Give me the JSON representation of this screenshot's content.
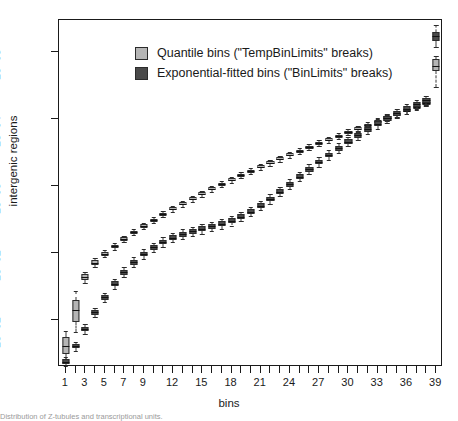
{
  "chart_data": {
    "type": "box",
    "title": "",
    "xlabel": "bins",
    "ylabel": "intergenic regions",
    "yscale": "log",
    "ylim": [
      2,
      300000
    ],
    "xlim": [
      0.3,
      39.7
    ],
    "grid": false,
    "legend_position": "top-left",
    "y_ticks": [
      "1e+01",
      "1e+02",
      "1e+03",
      "1e+04",
      "1e+05"
    ],
    "y_tick_values": [
      10,
      100,
      1000,
      10000,
      100000
    ],
    "x_ticks": [
      "1",
      "3",
      "5",
      "7",
      "9",
      "12",
      "15",
      "18",
      "21",
      "24",
      "27",
      "30",
      "33",
      "36",
      "39"
    ],
    "x_tick_values": [
      1,
      3,
      5,
      7,
      9,
      12,
      15,
      18,
      21,
      24,
      27,
      30,
      33,
      36,
      39
    ],
    "categories": [
      1,
      2,
      3,
      4,
      5,
      6,
      7,
      8,
      9,
      10,
      11,
      12,
      13,
      14,
      15,
      16,
      17,
      18,
      19,
      20,
      21,
      22,
      23,
      24,
      25,
      26,
      27,
      28,
      29,
      30,
      31,
      32,
      33,
      34,
      35,
      36,
      37,
      38,
      39
    ],
    "series": [
      {
        "name": "Quantile bins (\"TempBinLimits\" breaks)",
        "color": "#b5b5b5",
        "boxes": [
          {
            "bin": 1,
            "low": 2.6,
            "q1": 3.1,
            "median": 4.1,
            "q3": 5.6,
            "high": 7.0
          },
          {
            "bin": 2,
            "low": 6.6,
            "q1": 9.5,
            "median": 14.0,
            "q3": 20.0,
            "high": 27.0
          },
          {
            "bin": 3,
            "low": 36.0,
            "q1": 40.0,
            "median": 44.0,
            "q3": 48.0,
            "high": 53.0
          },
          {
            "bin": 4,
            "low": 62.0,
            "q1": 67.0,
            "median": 72.0,
            "q3": 78.0,
            "high": 84.0
          },
          {
            "bin": 5,
            "low": 86.0,
            "q1": 92.0,
            "median": 98.0,
            "q3": 105.0,
            "high": 112.0
          },
          {
            "bin": 6,
            "low": 112.0,
            "q1": 119.0,
            "median": 126.0,
            "q3": 134.0,
            "high": 142.0
          },
          {
            "bin": 7,
            "low": 145.0,
            "q1": 153.0,
            "median": 162.0,
            "q3": 172.0,
            "high": 182.0
          },
          {
            "bin": 8,
            "low": 183.0,
            "q1": 193.0,
            "median": 204.0,
            "q3": 216.0,
            "high": 228.0
          },
          {
            "bin": 9,
            "low": 228.0,
            "q1": 240.0,
            "median": 253.0,
            "q3": 267.0,
            "high": 282.0
          },
          {
            "bin": 10,
            "low": 280.0,
            "q1": 295.0,
            "median": 311.0,
            "q3": 328.0,
            "high": 346.0
          },
          {
            "bin": 11,
            "low": 340.0,
            "q1": 358.0,
            "median": 377.0,
            "q3": 397.0,
            "high": 419.0
          },
          {
            "bin": 12,
            "low": 410.0,
            "q1": 432.0,
            "median": 455.0,
            "q3": 479.0,
            "high": 505.0
          },
          {
            "bin": 13,
            "low": 492.0,
            "q1": 518.0,
            "median": 545.0,
            "q3": 574.0,
            "high": 604.0
          },
          {
            "bin": 14,
            "low": 586.0,
            "q1": 617.0,
            "median": 650.0,
            "q3": 684.0,
            "high": 720.0
          },
          {
            "bin": 15,
            "low": 695.0,
            "q1": 732.0,
            "median": 770.0,
            "q3": 811.0,
            "high": 854.0
          },
          {
            "bin": 16,
            "low": 820.0,
            "q1": 863.0,
            "median": 909.0,
            "q3": 957.0,
            "high": 1008.0
          },
          {
            "bin": 17,
            "low": 963.0,
            "q1": 1014.0,
            "median": 1068.0,
            "q3": 1124.0,
            "high": 1184.0
          },
          {
            "bin": 18,
            "low": 1124.0,
            "q1": 1184.0,
            "median": 1246.0,
            "q3": 1312.0,
            "high": 1382.0
          },
          {
            "bin": 19,
            "low": 1305.0,
            "q1": 1374.0,
            "median": 1447.0,
            "q3": 1523.0,
            "high": 1604.0
          },
          {
            "bin": 20,
            "low": 1510.0,
            "q1": 1590.0,
            "median": 1674.0,
            "q3": 1763.0,
            "high": 1856.0
          },
          {
            "bin": 21,
            "low": 1742.0,
            "q1": 1834.0,
            "median": 1931.0,
            "q3": 2034.0,
            "high": 2141.0
          },
          {
            "bin": 22,
            "low": 2003.0,
            "q1": 2109.0,
            "median": 2221.0,
            "q3": 2339.0,
            "high": 2463.0
          },
          {
            "bin": 23,
            "low": 2297.0,
            "q1": 2419.0,
            "median": 2547.0,
            "q3": 2682.0,
            "high": 2824.0
          },
          {
            "bin": 24,
            "low": 2628.0,
            "q1": 2767.0,
            "median": 2913.0,
            "q3": 3068.0,
            "high": 3230.0
          },
          {
            "bin": 25,
            "low": 3000.0,
            "q1": 3159.0,
            "median": 3327.0,
            "q3": 3503.0,
            "high": 3688.0
          },
          {
            "bin": 26,
            "low": 3420.0,
            "q1": 3601.0,
            "median": 3792.0,
            "q3": 3993.0,
            "high": 4204.0
          },
          {
            "bin": 27,
            "low": 3893.0,
            "q1": 4099.0,
            "median": 4316.0,
            "q3": 4545.0,
            "high": 4785.0
          },
          {
            "bin": 28,
            "low": 4426.0,
            "q1": 4660.0,
            "median": 4907.0,
            "q3": 5167.0,
            "high": 5440.0
          },
          {
            "bin": 29,
            "low": 5026.0,
            "q1": 5292.0,
            "median": 5572.0,
            "q3": 5867.0,
            "high": 6177.0
          },
          {
            "bin": 30,
            "low": 5703.0,
            "q1": 6005.0,
            "median": 6323.0,
            "q3": 6657.0,
            "high": 7010.0
          },
          {
            "bin": 31,
            "low": 6466.0,
            "q1": 6808.0,
            "median": 7168.0,
            "q3": 7548.0,
            "high": 7947.0
          },
          {
            "bin": 32,
            "low": 7326.0,
            "q1": 7714.0,
            "median": 8122.0,
            "q3": 8552.0,
            "high": 9005.0
          },
          {
            "bin": 33,
            "low": 8297.0,
            "q1": 8736.0,
            "median": 9198.0,
            "q3": 9685.0,
            "high": 10197.0
          },
          {
            "bin": 34,
            "low": 9393.0,
            "q1": 9890.0,
            "median": 10413.0,
            "q3": 10964.0,
            "high": 11544.0
          },
          {
            "bin": 35,
            "low": 10631.0,
            "q1": 11194.0,
            "median": 11786.0,
            "q3": 12410.0,
            "high": 13067.0
          },
          {
            "bin": 36,
            "low": 12029.0,
            "q1": 12666.0,
            "median": 13336.0,
            "q3": 14042.0,
            "high": 14785.0
          },
          {
            "bin": 37,
            "low": 13610.0,
            "q1": 14330.0,
            "median": 15089.0,
            "q3": 15888.0,
            "high": 16729.0
          },
          {
            "bin": 38,
            "low": 15398.0,
            "q1": 16213.0,
            "median": 17071.0,
            "q3": 17975.0,
            "high": 18926.0
          },
          {
            "bin": 39,
            "low": 30000.0,
            "q1": 52000.0,
            "median": 62000.0,
            "q3": 78000.0,
            "high": 88000.0
          }
        ]
      },
      {
        "name": "Exponential-fitted bins (\"BinLimits\" breaks)",
        "color": "#4a4a4a",
        "boxes": [
          {
            "bin": 1,
            "low": 2.1,
            "q1": 2.2,
            "median": 2.4,
            "q3": 2.6,
            "high": 2.8
          },
          {
            "bin": 2,
            "low": 3.5,
            "q1": 3.8,
            "median": 4.1,
            "q3": 4.4,
            "high": 4.8
          },
          {
            "bin": 3,
            "low": 6.2,
            "q1": 6.8,
            "median": 7.4,
            "q3": 8.0,
            "high": 8.7
          },
          {
            "bin": 4,
            "low": 11.0,
            "q1": 12.0,
            "median": 13.0,
            "q3": 14.1,
            "high": 15.3
          },
          {
            "bin": 5,
            "low": 18.5,
            "q1": 20.1,
            "median": 21.8,
            "q3": 23.7,
            "high": 25.7
          },
          {
            "bin": 6,
            "low": 29.5,
            "q1": 32.0,
            "median": 34.8,
            "q3": 37.8,
            "high": 41.0
          },
          {
            "bin": 7,
            "low": 44.0,
            "q1": 47.8,
            "median": 51.9,
            "q3": 56.4,
            "high": 61.2
          },
          {
            "bin": 8,
            "low": 62.0,
            "q1": 67.3,
            "median": 73.1,
            "q3": 79.4,
            "high": 86.2
          },
          {
            "bin": 9,
            "low": 82.0,
            "q1": 89.0,
            "median": 96.7,
            "q3": 105.0,
            "high": 114.0
          },
          {
            "bin": 10,
            "low": 103.0,
            "q1": 112.0,
            "median": 121.6,
            "q3": 132.0,
            "high": 143.4
          },
          {
            "bin": 11,
            "low": 124.0,
            "q1": 134.6,
            "median": 146.2,
            "q3": 158.8,
            "high": 172.5
          },
          {
            "bin": 12,
            "low": 144.0,
            "q1": 156.4,
            "median": 169.9,
            "q3": 184.5,
            "high": 200.4
          },
          {
            "bin": 13,
            "low": 162.0,
            "q1": 175.9,
            "median": 191.1,
            "q3": 207.6,
            "high": 225.5
          },
          {
            "bin": 14,
            "low": 179.0,
            "q1": 194.4,
            "median": 211.2,
            "q3": 229.4,
            "high": 249.2
          },
          {
            "bin": 15,
            "low": 195.0,
            "q1": 211.8,
            "median": 230.0,
            "q3": 249.8,
            "high": 271.4
          },
          {
            "bin": 16,
            "low": 212.0,
            "q1": 230.2,
            "median": 250.0,
            "q3": 271.6,
            "high": 295.0
          },
          {
            "bin": 17,
            "low": 232.0,
            "q1": 252.0,
            "median": 273.7,
            "q3": 297.3,
            "high": 322.9
          },
          {
            "bin": 18,
            "low": 258.0,
            "q1": 280.2,
            "median": 304.4,
            "q3": 330.6,
            "high": 359.1
          },
          {
            "bin": 19,
            "low": 296.0,
            "q1": 321.5,
            "median": 349.2,
            "q3": 379.3,
            "high": 411.9
          },
          {
            "bin": 20,
            "low": 352.0,
            "q1": 382.3,
            "median": 415.2,
            "q3": 451.0,
            "high": 489.8
          },
          {
            "bin": 21,
            "low": 432.0,
            "q1": 469.2,
            "median": 509.6,
            "q3": 553.4,
            "high": 601.1
          },
          {
            "bin": 22,
            "low": 545.0,
            "q1": 591.9,
            "median": 642.8,
            "q3": 698.1,
            "high": 758.2
          },
          {
            "bin": 23,
            "low": 700.0,
            "q1": 760.2,
            "median": 825.6,
            "q3": 896.6,
            "high": 973.8
          },
          {
            "bin": 24,
            "low": 905.0,
            "q1": 982.9,
            "median": 1067.4,
            "q3": 1159.3,
            "high": 1259.0
          },
          {
            "bin": 25,
            "low": 1172.0,
            "q1": 1272.8,
            "median": 1382.2,
            "q3": 1501.1,
            "high": 1630.3
          },
          {
            "bin": 26,
            "low": 1512.0,
            "q1": 1642.1,
            "median": 1783.3,
            "q3": 1936.7,
            "high": 2103.3
          },
          {
            "bin": 27,
            "low": 1940.0,
            "q1": 2106.9,
            "median": 2288.2,
            "q3": 2485.0,
            "high": 2698.8
          },
          {
            "bin": 28,
            "low": 2470.0,
            "q1": 2682.5,
            "median": 2913.2,
            "q3": 3163.8,
            "high": 3436.0
          },
          {
            "bin": 29,
            "low": 3120.0,
            "q1": 3388.4,
            "median": 3679.9,
            "q3": 3996.4,
            "high": 4340.2
          },
          {
            "bin": 30,
            "low": 3905.0,
            "q1": 4240.9,
            "median": 4605.7,
            "q3": 5001.9,
            "high": 5432.1
          },
          {
            "bin": 31,
            "low": 4840.0,
            "q1": 5256.4,
            "median": 5708.6,
            "q3": 6199.7,
            "high": 6733.0
          },
          {
            "bin": 32,
            "low": 5940.0,
            "q1": 6451.1,
            "median": 7006.0,
            "q3": 7608.7,
            "high": 8263.2
          },
          {
            "bin": 33,
            "low": 7210.0,
            "q1": 7830.3,
            "median": 8503.9,
            "q3": 9235.5,
            "high": 10030.0
          },
          {
            "bin": 34,
            "low": 8660.0,
            "q1": 9405.1,
            "median": 10214.0,
            "q3": 11093.0,
            "high": 12046.0
          },
          {
            "bin": 35,
            "low": 10280.0,
            "q1": 11164.0,
            "median": 12124.0,
            "q3": 13167.0,
            "high": 14300.0
          },
          {
            "bin": 36,
            "low": 12070.0,
            "q1": 13108.0,
            "median": 14236.0,
            "q3": 15460.0,
            "high": 16790.0
          },
          {
            "bin": 37,
            "low": 14020.0,
            "q1": 15226.0,
            "median": 16535.0,
            "q3": 17958.0,
            "high": 19502.0
          },
          {
            "bin": 38,
            "low": 16100.0,
            "q1": 17485.0,
            "median": 18989.0,
            "q3": 20622.0,
            "high": 22396.0
          },
          {
            "bin": 39,
            "low": 120000.0,
            "q1": 148000.0,
            "median": 172000.0,
            "q3": 200000.0,
            "high": 250000.0
          }
        ]
      }
    ]
  },
  "legend": {
    "items": [
      {
        "label": "Quantile bins (\"TempBinLimits\" breaks)",
        "color": "#b5b5b5"
      },
      {
        "label": "Exponential-fitted bins (\"BinLimits\" breaks)",
        "color": "#4a4a4a"
      }
    ]
  },
  "caption": "Distribution of Z-tubules and transcriptional units."
}
